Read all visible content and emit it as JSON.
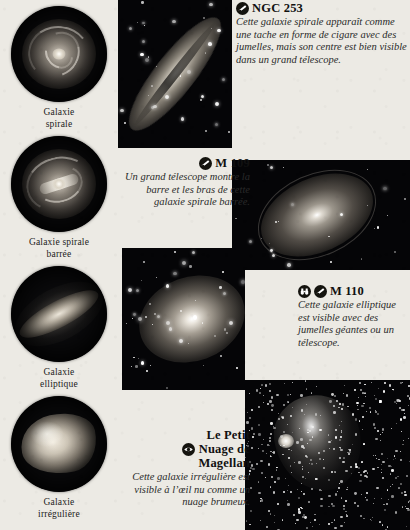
{
  "page": {
    "background_color": "#eceae4",
    "ink_color": "#1b1b1b"
  },
  "sidebar": {
    "items": [
      {
        "id": "spiral",
        "label": "Galaxie\nspirale",
        "label_line1": "Galaxie",
        "label_line2": "spirale",
        "illustration": "spiral-galaxy-disc"
      },
      {
        "id": "barred-spiral",
        "label": "Galaxie spirale\nbarrée",
        "label_line1": "Galaxie spirale",
        "label_line2": "barrée",
        "illustration": "barred-spiral-galaxy-disc"
      },
      {
        "id": "elliptical",
        "label": "Galaxie\nelliptique",
        "label_line1": "Galaxie",
        "label_line2": "elliptique",
        "illustration": "elliptical-galaxy-disc"
      },
      {
        "id": "irregular",
        "label": "Galaxie\nirrégulière",
        "label_line1": "Galaxie",
        "label_line2": "irrégulière",
        "illustration": "irregular-galaxy-disc"
      }
    ]
  },
  "objects": [
    {
      "id": "ngc253",
      "title": "NGC 253",
      "icons": [
        "telescope-badge-icon"
      ],
      "text": "Cette galaxie spirale apparaît comme une tache en forme de cigare avec des jumelles, mais son centre est bien visible dans un grand télescope.",
      "photo_caption": "ngc-253-photo",
      "on_dark": false,
      "align": "left"
    },
    {
      "id": "m109",
      "title": "M 109",
      "icons": [
        "telescope-badge-icon"
      ],
      "text": "Un grand télescope montre la barre et les bras de cette galaxie spirale barrée.",
      "photo_caption": "m-109-photo",
      "on_dark": false,
      "align": "right"
    },
    {
      "id": "m110",
      "title": "M 110",
      "icons": [
        "binoculars-badge-icon",
        "telescope-badge-icon"
      ],
      "text": "Cette galaxie elliptique est visible avec des jumelles géantes ou un télescope.",
      "photo_caption": "m-110-photo",
      "on_dark": false,
      "align": "left"
    },
    {
      "id": "smc",
      "title": "Le Petit Nuage de Magellan",
      "title_line1": "Le Petit",
      "title_line2": "Nuage de",
      "title_line3": "Magellan",
      "icons": [
        "naked-eye-badge-icon"
      ],
      "text": "Cette galaxie irrégulière est visible à l’œil nu comme un nuage brumeux.",
      "photo_caption": "small-magellanic-cloud-photo",
      "on_dark": false,
      "align": "right"
    }
  ]
}
